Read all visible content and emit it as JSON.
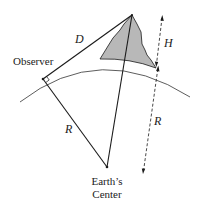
{
  "diagram": {
    "labels": {
      "observer": "Observer",
      "distance": "D",
      "height": "H",
      "radius_left": "R",
      "radius_right": "R",
      "center_line1": "Earth’s",
      "center_line2": "Center"
    },
    "colors": {
      "line": "#1a1a1a",
      "mountain_fill": "#b8b8b8",
      "background": "#ffffff"
    }
  }
}
